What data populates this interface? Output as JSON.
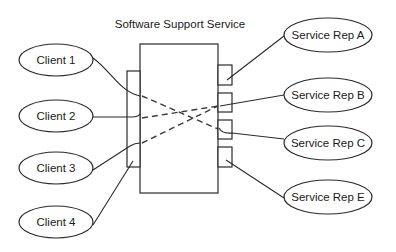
{
  "title": "Software Support Service",
  "clients": [
    {
      "label": "Client 1",
      "cx": 56,
      "cy": 60
    },
    {
      "label": "Client 2",
      "cx": 56,
      "cy": 116
    },
    {
      "label": "Client 3",
      "cx": 56,
      "cy": 168
    },
    {
      "label": "Client 4",
      "cx": 56,
      "cy": 222
    }
  ],
  "service_reps": [
    {
      "label": "Service Rep A",
      "cx": 328,
      "cy": 35
    },
    {
      "label": "Service Rep B",
      "cx": 328,
      "cy": 95
    },
    {
      "label": "Service Rep C",
      "cx": 328,
      "cy": 143
    },
    {
      "label": "Service Rep E",
      "cx": 328,
      "cy": 197
    }
  ],
  "connections": {
    "solid": [
      "Client 1 -> left port",
      "Client 2 -> left port",
      "Client 3 -> left port",
      "Client 4 -> left port",
      "right port A -> Service Rep A",
      "right port B -> Service Rep B",
      "right port C -> Service Rep C",
      "right port E -> Service Rep E"
    ],
    "dashed_internal": [
      "Client 1 -> Service Rep C",
      "Client 2 -> Service Rep B",
      "Client 3 -> Service Rep B"
    ]
  },
  "colors": {
    "stroke": "#2a2a2a",
    "background": "#ffffff",
    "text": "#1a1a1a"
  }
}
